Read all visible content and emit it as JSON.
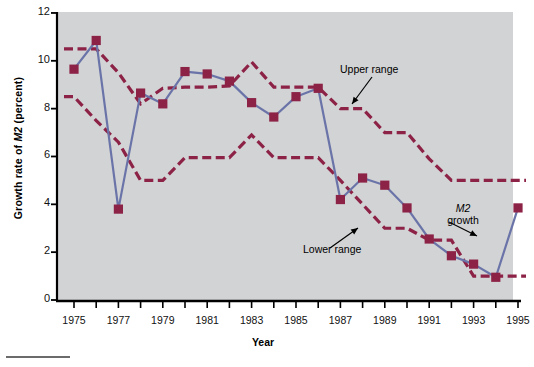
{
  "chart_data": {
    "type": "line",
    "title": "",
    "xlabel": "Year",
    "ylabel": "Growth rate of M2 (percent)",
    "ylabel_plain": "Growth rate of M2 (percent)",
    "xlim": [
      1974.3,
      1995.8
    ],
    "ylim": [
      0,
      12
    ],
    "yticks": [
      0,
      2,
      4,
      6,
      8,
      10,
      12
    ],
    "xticks": [
      1975,
      1976,
      1977,
      1978,
      1979,
      1980,
      1981,
      1982,
      1983,
      1984,
      1985,
      1986,
      1987,
      1988,
      1989,
      1990,
      1991,
      1992,
      1993,
      1994,
      1995
    ],
    "xtick_labels_shown": [
      1975,
      1977,
      1979,
      1981,
      1983,
      1985,
      1987,
      1989,
      1991,
      1993,
      1995
    ],
    "grid": false,
    "legend": "none",
    "plot_background": "#d2d3d4",
    "colors": {
      "m2_growth_line": "#6b74a8",
      "range_band": "#8c2246",
      "marker": "#8c2246",
      "axis": "#000000",
      "plot_bg": "#d2d3d4",
      "page_bg": "#ffffff"
    },
    "series": [
      {
        "name": "M2 growth",
        "style": "solid-line-with-square-markers",
        "color": "#6b74a8",
        "x": [
          1975,
          1976,
          1977,
          1978,
          1979,
          1980,
          1981,
          1982,
          1983,
          1984,
          1985,
          1986,
          1987,
          1988,
          1989,
          1990,
          1991,
          1992,
          1993,
          1994,
          1995
        ],
        "values": [
          9.65,
          10.85,
          3.8,
          8.65,
          8.2,
          9.55,
          9.45,
          9.15,
          8.25,
          7.65,
          8.5,
          8.85,
          4.2,
          5.1,
          4.8,
          3.85,
          2.55,
          1.85,
          1.5,
          0.95,
          3.85
        ]
      },
      {
        "name": "Upper range",
        "style": "dashed",
        "color": "#8c2246",
        "x": [
          1975,
          1976,
          1977,
          1978,
          1979,
          1980,
          1981,
          1982,
          1983,
          1984,
          1985,
          1986,
          1987,
          1988,
          1989,
          1990,
          1991,
          1992,
          1993,
          1994,
          1995
        ],
        "values": [
          10.5,
          10.5,
          9.5,
          8.2,
          8.85,
          8.9,
          8.9,
          8.95,
          9.95,
          8.9,
          8.9,
          8.9,
          8.0,
          8.0,
          7.0,
          7.0,
          5.9,
          5.0,
          5.0,
          5.0,
          5.0
        ]
      },
      {
        "name": "Lower range",
        "style": "dashed",
        "color": "#8c2246",
        "x": [
          1975,
          1976,
          1977,
          1978,
          1979,
          1980,
          1981,
          1982,
          1983,
          1984,
          1985,
          1986,
          1987,
          1988,
          1989,
          1990,
          1991,
          1992,
          1993,
          1994,
          1995
        ],
        "values": [
          8.5,
          7.5,
          6.6,
          5.0,
          5.0,
          5.95,
          5.95,
          5.95,
          6.9,
          5.95,
          5.95,
          5.95,
          5.0,
          4.0,
          3.0,
          3.0,
          2.5,
          2.5,
          1.0,
          1.0,
          1.0
        ]
      }
    ],
    "annotations": [
      {
        "id": "upper-range",
        "text": "Upper range",
        "points_to": "upper range dashed curve"
      },
      {
        "id": "lower-range",
        "text": "Lower range",
        "points_to": "lower range dashed curve"
      },
      {
        "id": "m2-growth",
        "text_line1": "M2",
        "text_line2": "growth",
        "points_to": "M2 growth solid line"
      }
    ]
  },
  "axis": {
    "ylabel_pre": "Growth rate of ",
    "ylabel_italic": "M2",
    "ylabel_post": " (percent)",
    "xlabel": "Year"
  },
  "annotations": {
    "upper": "Upper range",
    "lower": "Lower range",
    "m2_italic": "M2",
    "m2_rest": "growth"
  }
}
